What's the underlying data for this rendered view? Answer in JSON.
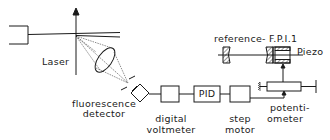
{
  "diagram": {
    "type": "schematic",
    "labels": {
      "laser": "Laser",
      "fluorescence_detector_line1": "fluorescence",
      "fluorescence_detector_line2": "detector",
      "digital_voltmeter_line1": "digital",
      "digital_voltmeter_line2": "voltmeter",
      "pid": "PID",
      "step_motor_line1": "step",
      "step_motor_line2": "motor",
      "potentiometer_line1": "potenti-",
      "potentiometer_line2": "ometer",
      "reference_fpi": "reference- F.P.I.1",
      "piezo": "Piezo"
    },
    "components": [
      "laser-source-box",
      "beam-arrow",
      "lens",
      "aperture",
      "fluorescence-detector",
      "digital-voltmeter",
      "PID",
      "step-motor",
      "potentiometer",
      "reference-FPI-mirror-left",
      "reference-FPI-mirror-right",
      "piezo"
    ],
    "connections": [
      [
        "fluorescence-detector",
        "digital-voltmeter"
      ],
      [
        "digital-voltmeter",
        "PID"
      ],
      [
        "PID",
        "step-motor"
      ],
      [
        "step-motor",
        "potentiometer"
      ],
      [
        "potentiometer",
        "piezo"
      ]
    ],
    "colors": {
      "line": "#1a1a1a",
      "background": "#ffffff"
    }
  }
}
